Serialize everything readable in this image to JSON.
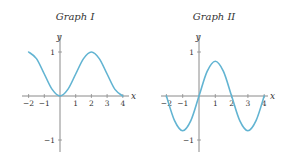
{
  "colors": {
    "curve": "#62b4d2",
    "axis": "#8a8a8a",
    "text": "#333333"
  },
  "chart_data": [
    {
      "type": "line",
      "title": "Graph I",
      "xlabel": "x",
      "ylabel": "y",
      "xlim": [
        -2,
        4
      ],
      "ylim": [
        -1,
        1
      ],
      "x_ticks": [
        "-2",
        "-1",
        "1",
        "2",
        "3",
        "4"
      ],
      "y_ticks": [
        "1",
        "-1"
      ],
      "grid": false,
      "legend": null,
      "series": [
        {
          "name": "Graph I curve",
          "x": [
            -2,
            -1.5,
            -1,
            -0.5,
            0,
            0.5,
            1,
            1.5,
            2,
            2.5,
            3,
            3.5,
            4
          ],
          "y": [
            1,
            0.85,
            0.5,
            0.15,
            0,
            0.15,
            0.5,
            0.85,
            1,
            0.85,
            0.5,
            0.15,
            0
          ]
        }
      ]
    },
    {
      "type": "line",
      "title": "Graph II",
      "xlabel": "x",
      "ylabel": "y",
      "xlim": [
        -2,
        4
      ],
      "ylim": [
        -1,
        1
      ],
      "x_ticks": [
        "-2",
        "-1",
        "1",
        "2",
        "3",
        "4"
      ],
      "y_ticks": [
        "1",
        "-1"
      ],
      "grid": false,
      "legend": null,
      "series": [
        {
          "name": "Graph II curve",
          "x": [
            -2,
            -1.5,
            -1,
            -0.5,
            0,
            0.5,
            1,
            1.5,
            2,
            2.5,
            3,
            3.5,
            4
          ],
          "y": [
            0,
            -0.56,
            -0.79,
            -0.56,
            0,
            0.56,
            0.79,
            0.56,
            0,
            -0.56,
            -0.79,
            -0.56,
            0
          ]
        }
      ]
    }
  ],
  "graphs": [
    {
      "title": "Graph I",
      "xlabel": "x",
      "ylabel": "y",
      "xticks": [
        "−2",
        "−1",
        "1",
        "2",
        "3",
        "4"
      ],
      "ytick_top": "1",
      "ytick_bottom": "−1"
    },
    {
      "title": "Graph II",
      "xlabel": "x",
      "ylabel": "y",
      "xticks": [
        "−2",
        "−1",
        "1",
        "2",
        "3",
        "4"
      ],
      "ytick_top": "1",
      "ytick_bottom": "−1"
    }
  ]
}
